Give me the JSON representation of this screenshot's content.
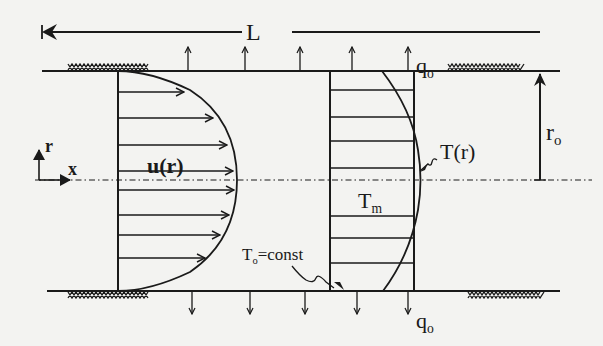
{
  "diagram": {
    "labels": {
      "length": "L",
      "heat_flux_top": "q",
      "heat_flux_top_sub": "o",
      "heat_flux_bottom": "q",
      "heat_flux_bottom_sub": "o",
      "radius": "r",
      "radius_sub": "o",
      "velocity_profile": "u(r)",
      "temperature_profile": "T(r)",
      "mean_temperature": "T",
      "mean_temperature_sub": "m",
      "wall_temperature": "T",
      "wall_temperature_sub": "o",
      "wall_temperature_suffix": "=const",
      "axis_r": "r",
      "axis_x": "x"
    },
    "geometry": {
      "top_wall_y": 71,
      "bottom_wall_y": 291,
      "centerline_y": 180,
      "wall_x_start": 42,
      "wall_x_end": 560,
      "velocity_profile_base_x": 118,
      "velocity_profile_peak_x": 237,
      "temperature_box_left_x": 330,
      "temperature_box_right_x": 414,
      "temperature_profile_peak_x": 423,
      "radius_arrow_x": 540
    },
    "heat_flux_arrows": {
      "top_x": [
        188,
        245,
        300,
        352,
        408
      ],
      "bottom_x": [
        192,
        250,
        305,
        357,
        408
      ]
    },
    "velocity_arrows_y": [
      92,
      118,
      145,
      171,
      195,
      214,
      234,
      258
    ],
    "temperature_lines_y": [
      90,
      117,
      141,
      168,
      216,
      238,
      263
    ],
    "colors": {
      "ink": "#1a1a1a",
      "background": "#f3f3f1"
    }
  }
}
